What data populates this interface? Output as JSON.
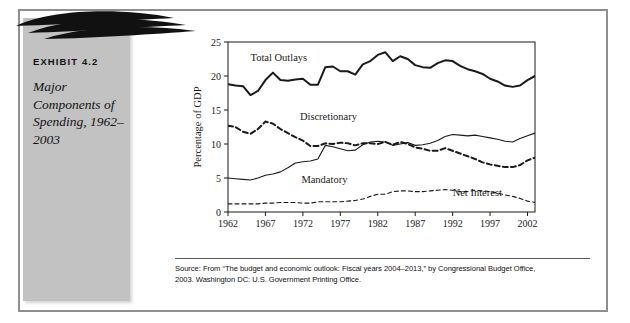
{
  "exhibit": {
    "label": "EXHIBIT 4.2",
    "title": "Major Components of Spending, 1962–2003"
  },
  "source": {
    "line1": "Source: From “The budget and economic outlook: Fiscal years 2004–2013,” by Congressional Budget Office,",
    "line2": "2003. Washington DC: U.S. Government Printing Office."
  },
  "colors": {
    "panel_gray": "#c2c2c2",
    "frame_gray": "#8f8f8f",
    "ink": "#111111",
    "plot_line": "#1a1a1a"
  },
  "chart_data": {
    "type": "line",
    "title": "",
    "xlabel": "Year",
    "ylabel": "Percentage of GDP",
    "xlim": [
      1962,
      2003
    ],
    "ylim": [
      0,
      25
    ],
    "xticks": [
      1962,
      1967,
      1972,
      1977,
      1982,
      1987,
      1992,
      1997,
      2002
    ],
    "xtick_labels": [
      "1962",
      "1967",
      "1972",
      "1977",
      "1982",
      "1987",
      "1992",
      "1997",
      "2002"
    ],
    "yticks": [
      0,
      5,
      10,
      15,
      20,
      25
    ],
    "ytick_labels": [
      "0",
      "5",
      "10",
      "15",
      "20",
      "25"
    ],
    "grid": false,
    "legend": "inline-annotations",
    "annotations": [
      {
        "text": "Total Outlays",
        "x": 1965.0,
        "y": 22.2
      },
      {
        "text": "Discretionary",
        "x": 1971.6,
        "y": 13.6
      },
      {
        "text": "Mandatory",
        "x": 1971.8,
        "y": 4.3
      },
      {
        "text": "Net Interest",
        "x": 1992.0,
        "y": 2.3
      }
    ],
    "x": [
      1962,
      1963,
      1964,
      1965,
      1966,
      1967,
      1968,
      1969,
      1970,
      1971,
      1972,
      1973,
      1974,
      1975,
      1976,
      1977,
      1978,
      1979,
      1980,
      1981,
      1982,
      1983,
      1984,
      1985,
      1986,
      1987,
      1988,
      1989,
      1990,
      1991,
      1992,
      1993,
      1994,
      1995,
      1996,
      1997,
      1998,
      1999,
      2000,
      2001,
      2002,
      2003
    ],
    "series": [
      {
        "name": "Total Outlays",
        "style": "solid",
        "width": 2.0,
        "values": [
          18.8,
          18.6,
          18.5,
          17.2,
          17.8,
          19.4,
          20.5,
          19.4,
          19.3,
          19.5,
          19.6,
          18.7,
          18.7,
          21.3,
          21.4,
          20.7,
          20.7,
          20.2,
          21.7,
          22.2,
          23.1,
          23.5,
          22.2,
          22.9,
          22.5,
          21.6,
          21.3,
          21.2,
          21.9,
          22.3,
          22.2,
          21.5,
          21.0,
          20.7,
          20.3,
          19.6,
          19.2,
          18.6,
          18.4,
          18.6,
          19.4,
          20.0
        ]
      },
      {
        "name": "Discretionary",
        "style": "dashed",
        "width": 2.0,
        "values": [
          12.7,
          12.5,
          11.8,
          11.5,
          12.2,
          13.3,
          13.0,
          12.2,
          11.6,
          11.0,
          10.5,
          9.7,
          9.7,
          10.1,
          10.0,
          10.2,
          10.1,
          9.8,
          10.1,
          10.1,
          10.0,
          10.3,
          9.9,
          10.3,
          10.0,
          9.5,
          9.3,
          9.0,
          9.0,
          9.4,
          9.0,
          8.6,
          8.2,
          7.8,
          7.3,
          7.0,
          6.8,
          6.6,
          6.6,
          6.9,
          7.6,
          8.0
        ]
      },
      {
        "name": "Mandatory",
        "style": "solid",
        "width": 1.1,
        "values": [
          5.0,
          4.9,
          4.8,
          4.7,
          5.0,
          5.4,
          5.6,
          5.9,
          6.5,
          7.2,
          7.4,
          7.5,
          7.8,
          9.8,
          9.6,
          9.3,
          9.0,
          9.1,
          9.9,
          10.3,
          10.4,
          10.3,
          9.8,
          10.0,
          10.2,
          9.8,
          9.9,
          10.1,
          10.5,
          11.1,
          11.4,
          11.3,
          11.2,
          11.3,
          11.1,
          10.9,
          10.7,
          10.4,
          10.3,
          10.8,
          11.2,
          11.6
        ]
      },
      {
        "name": "Net Interest",
        "style": "dashed",
        "width": 1.1,
        "values": [
          1.2,
          1.2,
          1.2,
          1.2,
          1.2,
          1.3,
          1.3,
          1.4,
          1.4,
          1.4,
          1.3,
          1.3,
          1.5,
          1.5,
          1.5,
          1.5,
          1.6,
          1.7,
          1.9,
          2.3,
          2.6,
          2.6,
          3.0,
          3.1,
          3.1,
          3.0,
          3.0,
          3.1,
          3.2,
          3.3,
          3.2,
          3.0,
          3.0,
          3.2,
          3.1,
          3.0,
          2.8,
          2.5,
          2.3,
          2.0,
          1.6,
          1.4
        ]
      }
    ]
  }
}
